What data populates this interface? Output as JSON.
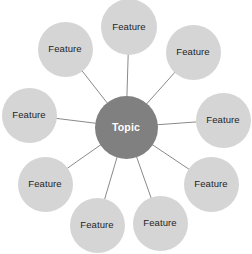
{
  "diagram": {
    "type": "radial-hub-and-spoke",
    "canvas": {
      "width": 252,
      "height": 254,
      "background": "#ffffff"
    },
    "colors": {
      "center_fill": "#808080",
      "center_text": "#ffffff",
      "feature_fill": "#d5d5d5",
      "feature_text": "#1e1e1e",
      "connector_line": "#8a8a8a"
    },
    "center": {
      "label": "Topic",
      "cx": 126,
      "cy": 127,
      "diameter": 63
    },
    "features": [
      {
        "label": "Feature",
        "cx": 129,
        "cy": 27,
        "diameter": 56
      },
      {
        "label": "Feature",
        "cx": 193,
        "cy": 52,
        "diameter": 55
      },
      {
        "label": "Feature",
        "cx": 223,
        "cy": 120,
        "diameter": 55
      },
      {
        "label": "Feature",
        "cx": 211,
        "cy": 184,
        "diameter": 55
      },
      {
        "label": "Feature",
        "cx": 160,
        "cy": 223,
        "diameter": 55
      },
      {
        "label": "Feature",
        "cx": 97,
        "cy": 225,
        "diameter": 55
      },
      {
        "label": "Feature",
        "cx": 45,
        "cy": 184,
        "diameter": 55
      },
      {
        "label": "Feature",
        "cx": 29,
        "cy": 115,
        "diameter": 55
      },
      {
        "label": "Feature",
        "cx": 65,
        "cy": 49,
        "diameter": 55
      }
    ]
  }
}
